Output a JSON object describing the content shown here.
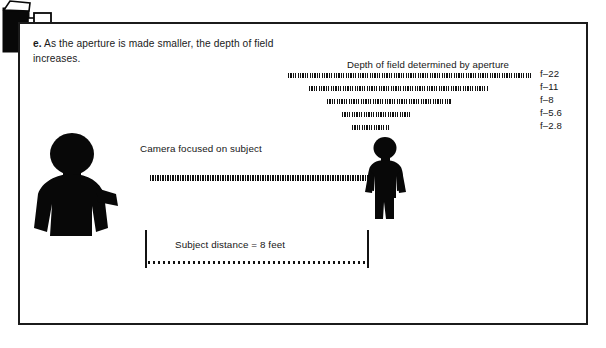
{
  "figure": {
    "caption_lead": "e.",
    "caption_text": "As the aperture is made smaller, the depth of field increases.",
    "border_color": "#1b1b1b",
    "ink_color": "#111111"
  },
  "depth_of_field": {
    "title": "Depth of field determined by aperture",
    "bars": [
      {
        "label": "f–22",
        "start_px": 288,
        "end_px": 531,
        "top_px": 73
      },
      {
        "label": "f–11",
        "start_px": 309,
        "end_px": 489,
        "top_px": 86
      },
      {
        "label": "f–8",
        "start_px": 327,
        "end_px": 452,
        "top_px": 99
      },
      {
        "label": "f–5.6",
        "start_px": 342,
        "end_px": 410,
        "top_px": 112
      },
      {
        "label": "f–2.8",
        "start_px": 352,
        "end_px": 390,
        "top_px": 125
      }
    ],
    "label_tops": [
      68,
      81,
      94,
      107,
      120
    ]
  },
  "focus": {
    "caption": "Camera focused on subject"
  },
  "distance": {
    "caption": "Subject distance = 8 feet",
    "value": "8",
    "unit": "feet"
  },
  "icons": {
    "photographer": "photographer-silhouette",
    "subject": "subject-silhouette",
    "camera": "camera-icon"
  },
  "chart_data": {
    "type": "bar",
    "title": "Depth of field determined by aperture",
    "categories": [
      "f–22",
      "f–11",
      "f–8",
      "f–5.6",
      "f–2.8"
    ],
    "values": [
      243,
      180,
      125,
      68,
      38
    ],
    "near_limits": [
      288,
      309,
      327,
      342,
      352
    ],
    "far_limits": [
      531,
      489,
      452,
      410,
      390
    ],
    "xlabel": "Distance from camera",
    "ylabel": "Aperture",
    "legend": [
      "Depth of field determined by aperture"
    ],
    "annotations": [
      "Camera focused on subject",
      "Subject distance = 8 feet"
    ],
    "grid": false
  }
}
